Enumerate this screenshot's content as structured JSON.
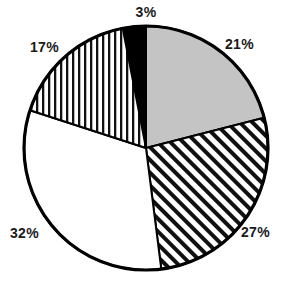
{
  "chart_data": {
    "type": "pie",
    "title": "",
    "subtitle": "",
    "xlabel": "",
    "ylabel": "",
    "legend": "none",
    "grid": false,
    "labels_shown": "percentage",
    "start_angle_deg": -11,
    "direction": "clockwise",
    "categories": [
      "3%",
      "21%",
      "27%",
      "32%",
      "17%"
    ],
    "values": [
      3,
      21,
      27,
      32,
      17
    ],
    "slices": [
      {
        "label": "3%",
        "value": 3,
        "fill_style": "solid-black",
        "fill_color": "#000000",
        "start_deg": -11,
        "end_deg": 0
      },
      {
        "label": "21%",
        "value": 21,
        "fill_style": "solid-gray",
        "fill_color": "#c4c4c4",
        "start_deg": 0,
        "end_deg": 75.6
      },
      {
        "label": "27%",
        "value": 27,
        "fill_style": "diagonal-hatch",
        "fill_color": "#ffffff",
        "start_deg": 75.6,
        "end_deg": 172.8
      },
      {
        "label": "32%",
        "value": 32,
        "fill_style": "solid-white",
        "fill_color": "#ffffff",
        "start_deg": 172.8,
        "end_deg": 288.0
      },
      {
        "label": "17%",
        "value": 17,
        "fill_style": "vertical-stripes",
        "fill_color": "#ffffff",
        "start_deg": 288.0,
        "end_deg": 349.0
      }
    ],
    "geometry": {
      "center_x": 146,
      "center_y": 148,
      "radius": 122,
      "outline_color": "#000000",
      "outline_width": 3
    },
    "total": 100
  },
  "labels": {
    "top": "3%",
    "upper_right": "21%",
    "lower_right": "27%",
    "lower_left": "32%",
    "upper_left": "17%"
  }
}
